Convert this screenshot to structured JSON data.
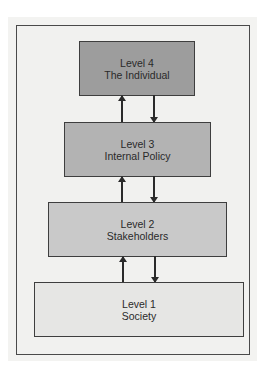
{
  "diagram": {
    "type": "hierarchical-levels",
    "levels": [
      {
        "id": 4,
        "line1": "Level 4",
        "line2": "The Individual",
        "color": "#9d9d9d"
      },
      {
        "id": 3,
        "line1": "Level 3",
        "line2": "Internal Policy",
        "color": "#b3b3b3"
      },
      {
        "id": 2,
        "line1": "Level 2",
        "line2": "Stakeholders",
        "color": "#c9c9c9"
      },
      {
        "id": 1,
        "line1": "Level 1",
        "line2": "Society",
        "color": "#e6e6e4"
      }
    ],
    "connections": [
      {
        "from": 3,
        "to": 4,
        "direction": "up"
      },
      {
        "from": 4,
        "to": 3,
        "direction": "down"
      },
      {
        "from": 2,
        "to": 3,
        "direction": "up"
      },
      {
        "from": 3,
        "to": 2,
        "direction": "down"
      },
      {
        "from": 1,
        "to": 2,
        "direction": "up"
      },
      {
        "from": 2,
        "to": 1,
        "direction": "down"
      }
    ]
  }
}
